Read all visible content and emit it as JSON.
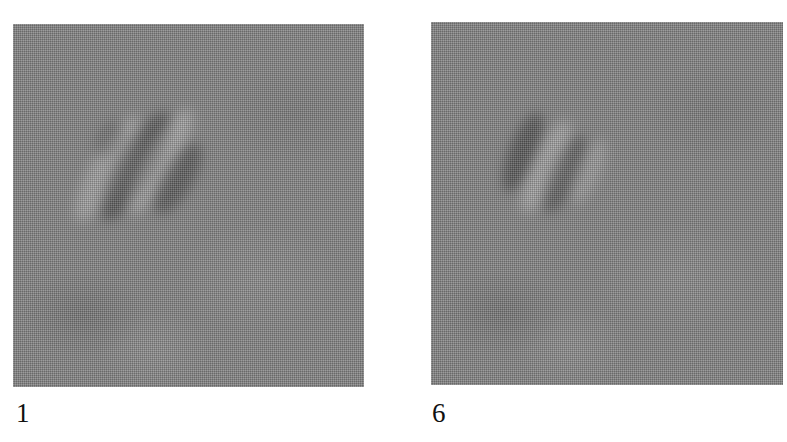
{
  "figure": {
    "panels": [
      {
        "label": "1",
        "description": "noisy grayscale image with diagonal dark/light stripe pattern in upper-left",
        "background_color": "#858585"
      },
      {
        "label": "6",
        "description": "noisy grayscale image with fainter diagonal dark/light stripe pattern in upper-left",
        "background_color": "#858585"
      }
    ]
  }
}
